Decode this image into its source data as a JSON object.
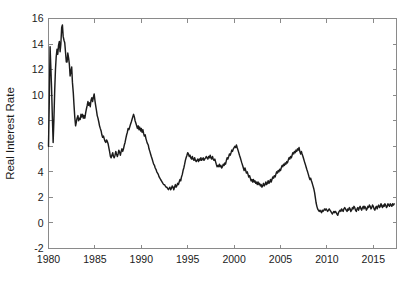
{
  "chart_data": {
    "type": "line",
    "title": "",
    "xlabel": "",
    "ylabel": "Real Interest Rate",
    "xlim": [
      1980.0,
      2017.5
    ],
    "ylim": [
      -2,
      16
    ],
    "xticks": [
      1980,
      1985,
      1990,
      1995,
      2000,
      2005,
      2010,
      2015
    ],
    "xticklabels": [
      "1980",
      "1985",
      "1990",
      "1995",
      "2000",
      "2005",
      "2010",
      "2015"
    ],
    "yticks": [
      -2,
      0,
      2,
      4,
      6,
      8,
      10,
      12,
      14,
      16
    ],
    "yticklabels": [
      "-2",
      "0",
      "2",
      "4",
      "6",
      "8",
      "10",
      "12",
      "14",
      "16"
    ],
    "grid": false,
    "legend": null,
    "line_color": "#1c1c1c",
    "axis_color": "#8a8a8a",
    "background_color": "#ffffff",
    "series": [
      {
        "name": "Real Interest Rate",
        "x": [
          1980.0,
          1980.08,
          1980.17,
          1980.25,
          1980.33,
          1980.42,
          1980.5,
          1980.58,
          1980.67,
          1980.75,
          1980.83,
          1980.92,
          1981.0,
          1981.08,
          1981.17,
          1981.25,
          1981.33,
          1981.42,
          1981.5,
          1981.58,
          1981.67,
          1981.75,
          1981.83,
          1981.92,
          1982.0,
          1982.08,
          1982.17,
          1982.25,
          1982.33,
          1982.42,
          1982.5,
          1982.58,
          1982.67,
          1982.75,
          1982.83,
          1982.92,
          1983.0,
          1983.08,
          1983.17,
          1983.25,
          1983.33,
          1983.42,
          1983.5,
          1983.58,
          1983.67,
          1983.75,
          1983.83,
          1983.92,
          1984.0,
          1984.08,
          1984.17,
          1984.25,
          1984.33,
          1984.42,
          1984.5,
          1984.58,
          1984.67,
          1984.75,
          1984.83,
          1984.92,
          1985.0,
          1985.08,
          1985.17,
          1985.25,
          1985.33,
          1985.42,
          1985.5,
          1985.58,
          1985.67,
          1985.75,
          1985.83,
          1985.92,
          1986.0,
          1986.08,
          1986.17,
          1986.25,
          1986.33,
          1986.42,
          1986.5,
          1986.58,
          1986.67,
          1986.75,
          1986.83,
          1986.92,
          1987.0,
          1987.08,
          1987.17,
          1987.25,
          1987.33,
          1987.42,
          1987.5,
          1987.58,
          1987.67,
          1987.75,
          1987.83,
          1987.92,
          1988.0,
          1988.08,
          1988.17,
          1988.25,
          1988.33,
          1988.42,
          1988.5,
          1988.58,
          1988.67,
          1988.75,
          1988.83,
          1988.92,
          1989.0,
          1989.08,
          1989.17,
          1989.25,
          1989.33,
          1989.42,
          1989.5,
          1989.58,
          1989.67,
          1989.75,
          1989.83,
          1989.92,
          1990.0,
          1990.08,
          1990.17,
          1990.25,
          1990.33,
          1990.42,
          1990.5,
          1990.58,
          1990.67,
          1990.75,
          1990.83,
          1990.92,
          1991.0,
          1991.08,
          1991.17,
          1991.25,
          1991.33,
          1991.42,
          1991.5,
          1991.58,
          1991.67,
          1991.75,
          1991.83,
          1991.92,
          1992.0,
          1992.08,
          1992.17,
          1992.25,
          1992.33,
          1992.42,
          1992.5,
          1992.58,
          1992.67,
          1992.75,
          1992.83,
          1992.92,
          1993.0,
          1993.08,
          1993.17,
          1993.25,
          1993.33,
          1993.42,
          1993.5,
          1993.58,
          1993.67,
          1993.75,
          1993.83,
          1993.92,
          1994.0,
          1994.08,
          1994.17,
          1994.25,
          1994.33,
          1994.42,
          1994.5,
          1994.58,
          1994.67,
          1994.75,
          1994.83,
          1994.92,
          1995.0,
          1995.08,
          1995.17,
          1995.25,
          1995.33,
          1995.42,
          1995.5,
          1995.58,
          1995.67,
          1995.75,
          1995.83,
          1995.92,
          1996.0,
          1996.08,
          1996.17,
          1996.25,
          1996.33,
          1996.42,
          1996.5,
          1996.58,
          1996.67,
          1996.75,
          1996.83,
          1996.92,
          1997.0,
          1997.08,
          1997.17,
          1997.25,
          1997.33,
          1997.42,
          1997.5,
          1997.58,
          1997.67,
          1997.75,
          1997.83,
          1997.92,
          1998.0,
          1998.08,
          1998.17,
          1998.25,
          1998.33,
          1998.42,
          1998.5,
          1998.58,
          1998.67,
          1998.75,
          1998.83,
          1998.92,
          1999.0,
          1999.08,
          1999.17,
          1999.25,
          1999.33,
          1999.42,
          1999.5,
          1999.58,
          1999.67,
          1999.75,
          1999.83,
          1999.92,
          2000.0,
          2000.08,
          2000.17,
          2000.25,
          2000.33,
          2000.42,
          2000.5,
          2000.58,
          2000.67,
          2000.75,
          2000.83,
          2000.92,
          2001.0,
          2001.08,
          2001.17,
          2001.25,
          2001.33,
          2001.42,
          2001.5,
          2001.58,
          2001.67,
          2001.75,
          2001.83,
          2001.92,
          2002.0,
          2002.08,
          2002.17,
          2002.25,
          2002.33,
          2002.42,
          2002.5,
          2002.58,
          2002.67,
          2002.75,
          2002.83,
          2002.92,
          2003.0,
          2003.08,
          2003.17,
          2003.25,
          2003.33,
          2003.42,
          2003.5,
          2003.58,
          2003.67,
          2003.75,
          2003.83,
          2003.92,
          2004.0,
          2004.08,
          2004.17,
          2004.25,
          2004.33,
          2004.42,
          2004.5,
          2004.58,
          2004.67,
          2004.75,
          2004.83,
          2004.92,
          2005.0,
          2005.08,
          2005.17,
          2005.25,
          2005.33,
          2005.42,
          2005.5,
          2005.58,
          2005.67,
          2005.75,
          2005.83,
          2005.92,
          2006.0,
          2006.08,
          2006.17,
          2006.25,
          2006.33,
          2006.42,
          2006.5,
          2006.58,
          2006.67,
          2006.75,
          2006.83,
          2006.92,
          2007.0,
          2007.08,
          2007.17,
          2007.25,
          2007.33,
          2007.42,
          2007.5,
          2007.58,
          2007.67,
          2007.75,
          2007.83,
          2007.92,
          2008.0,
          2008.08,
          2008.17,
          2008.25,
          2008.33,
          2008.42,
          2008.5,
          2008.58,
          2008.67,
          2008.75,
          2008.83,
          2008.92,
          2009.0,
          2009.08,
          2009.17,
          2009.25,
          2009.33,
          2009.42,
          2009.5,
          2009.58,
          2009.67,
          2009.75,
          2009.83,
          2009.92,
          2010.0,
          2010.08,
          2010.17,
          2010.25,
          2010.33,
          2010.42,
          2010.5,
          2010.58,
          2010.67,
          2010.75,
          2010.83,
          2010.92,
          2011.0,
          2011.08,
          2011.17,
          2011.25,
          2011.33,
          2011.42,
          2011.5,
          2011.58,
          2011.67,
          2011.75,
          2011.83,
          2011.92,
          2012.0,
          2012.08,
          2012.17,
          2012.25,
          2012.33,
          2012.42,
          2012.5,
          2012.58,
          2012.67,
          2012.75,
          2012.83,
          2012.92,
          2013.0,
          2013.08,
          2013.17,
          2013.25,
          2013.33,
          2013.42,
          2013.5,
          2013.58,
          2013.67,
          2013.75,
          2013.83,
          2013.92,
          2014.0,
          2014.08,
          2014.17,
          2014.25,
          2014.33,
          2014.42,
          2014.5,
          2014.58,
          2014.67,
          2014.75,
          2014.83,
          2014.92,
          2015.0,
          2015.08,
          2015.17,
          2015.25,
          2015.33,
          2015.42,
          2015.5,
          2015.58,
          2015.67,
          2015.75,
          2015.83,
          2015.92,
          2016.0,
          2016.08,
          2016.17,
          2016.25,
          2016.33,
          2016.42,
          2016.5,
          2016.58,
          2016.67,
          2016.75,
          2016.83,
          2016.92,
          2017.0,
          2017.08,
          2017.17,
          2017.25
        ],
        "values": [
          6.0,
          9.3,
          13.8,
          12.2,
          10.6,
          8.2,
          6.3,
          8.0,
          10.4,
          12.0,
          13.0,
          13.6,
          13.2,
          13.9,
          14.2,
          13.4,
          14.0,
          15.3,
          15.5,
          14.6,
          14.3,
          14.1,
          13.4,
          12.6,
          12.6,
          13.3,
          12.9,
          12.4,
          11.5,
          11.9,
          12.2,
          11.0,
          10.2,
          9.2,
          8.3,
          7.6,
          7.9,
          8.2,
          8.4,
          8.0,
          8.2,
          8.1,
          8.5,
          8.3,
          8.5,
          8.2,
          8.4,
          8.2,
          8.6,
          8.9,
          9.2,
          9.5,
          9.2,
          9.4,
          9.1,
          9.6,
          9.8,
          9.5,
          9.8,
          10.1,
          9.6,
          9.2,
          8.8,
          8.4,
          8.2,
          7.9,
          7.6,
          7.4,
          7.2,
          6.9,
          6.7,
          6.8,
          6.6,
          6.4,
          6.3,
          6.5,
          6.4,
          6.2,
          5.9,
          5.6,
          5.2,
          5.1,
          5.3,
          5.5,
          5.2,
          5.1,
          5.3,
          5.6,
          5.4,
          5.2,
          5.4,
          5.7,
          5.5,
          5.3,
          5.6,
          5.8,
          5.6,
          5.8,
          6.1,
          6.3,
          6.6,
          6.9,
          7.1,
          7.4,
          7.3,
          7.5,
          7.7,
          7.9,
          8.1,
          8.3,
          8.5,
          8.3,
          8.0,
          7.8,
          7.6,
          7.4,
          7.6,
          7.3,
          7.5,
          7.2,
          7.4,
          7.1,
          7.3,
          7.0,
          6.8,
          6.9,
          6.6,
          6.4,
          6.2,
          6.1,
          5.8,
          5.6,
          5.4,
          5.2,
          5.0,
          4.8,
          4.6,
          4.5,
          4.3,
          4.2,
          4.0,
          3.9,
          3.8,
          3.6,
          3.5,
          3.4,
          3.3,
          3.2,
          3.1,
          3.0,
          3.0,
          2.9,
          2.8,
          2.8,
          2.7,
          2.6,
          2.7,
          2.8,
          2.6,
          2.7,
          2.9,
          2.8,
          2.6,
          2.8,
          3.0,
          2.8,
          2.9,
          3.1,
          3.0,
          3.2,
          3.4,
          3.3,
          3.6,
          3.8,
          4.1,
          4.3,
          4.6,
          4.9,
          5.1,
          5.3,
          5.5,
          5.4,
          5.2,
          5.3,
          5.1,
          5.0,
          5.2,
          5.0,
          4.9,
          5.1,
          4.9,
          4.8,
          4.9,
          5.0,
          4.8,
          5.0,
          4.9,
          5.1,
          4.9,
          5.0,
          5.1,
          4.9,
          5.0,
          5.1,
          5.2,
          5.1,
          5.0,
          5.2,
          5.1,
          5.3,
          5.1,
          5.0,
          5.2,
          5.0,
          4.9,
          5.0,
          4.8,
          4.6,
          4.4,
          4.5,
          4.4,
          4.6,
          4.4,
          4.5,
          4.3,
          4.4,
          4.6,
          4.5,
          4.7,
          4.6,
          4.9,
          5.1,
          5.0,
          5.2,
          5.4,
          5.3,
          5.5,
          5.7,
          5.6,
          5.8,
          5.9,
          6.0,
          5.9,
          6.1,
          5.9,
          5.7,
          5.5,
          5.3,
          5.1,
          4.9,
          4.7,
          4.5,
          4.3,
          4.1,
          4.3,
          4.1,
          3.9,
          4.0,
          3.8,
          3.6,
          3.7,
          3.5,
          3.3,
          3.4,
          3.2,
          3.4,
          3.2,
          3.3,
          3.1,
          3.2,
          3.0,
          3.2,
          3.0,
          3.1,
          2.9,
          3.0,
          2.8,
          2.9,
          3.1,
          2.9,
          3.0,
          3.2,
          3.0,
          3.1,
          3.3,
          3.1,
          3.2,
          3.4,
          3.2,
          3.4,
          3.6,
          3.5,
          3.7,
          3.6,
          3.8,
          4.0,
          3.9,
          4.1,
          4.0,
          4.2,
          4.1,
          4.3,
          4.5,
          4.4,
          4.6,
          4.5,
          4.7,
          4.6,
          4.8,
          4.7,
          4.9,
          5.1,
          5.0,
          5.2,
          5.1,
          5.3,
          5.5,
          5.4,
          5.6,
          5.5,
          5.7,
          5.6,
          5.8,
          5.7,
          5.9,
          5.6,
          5.4,
          5.6,
          5.4,
          5.2,
          5.0,
          4.8,
          4.6,
          4.4,
          4.2,
          4.0,
          3.8,
          3.6,
          3.4,
          3.5,
          3.3,
          3.1,
          2.9,
          2.7,
          2.4,
          2.0,
          1.6,
          1.3,
          1.1,
          1.0,
          0.9,
          1.0,
          0.9,
          0.8,
          1.0,
          0.9,
          1.0,
          1.1,
          1.0,
          1.1,
          1.0,
          0.9,
          1.0,
          1.1,
          1.0,
          0.9,
          0.8,
          0.7,
          0.8,
          0.9,
          0.8,
          0.9,
          0.8,
          0.7,
          0.6,
          0.8,
          0.9,
          1.0,
          0.9,
          1.1,
          1.0,
          0.9,
          1.1,
          1.2,
          1.1,
          1.0,
          0.9,
          1.1,
          1.0,
          1.2,
          1.1,
          0.9,
          1.0,
          1.2,
          1.1,
          1.3,
          1.2,
          1.0,
          0.9,
          1.1,
          1.2,
          1.0,
          1.2,
          1.3,
          1.1,
          1.0,
          1.2,
          1.3,
          1.1,
          1.3,
          1.2,
          1.0,
          1.1,
          1.3,
          1.2,
          1.4,
          1.3,
          1.1,
          1.2,
          1.4,
          1.3,
          1.1,
          1.0,
          1.2,
          1.3,
          1.1,
          1.3,
          1.4,
          1.2,
          1.3,
          1.5,
          1.3,
          1.2,
          1.4,
          1.3,
          1.5,
          1.4,
          1.2,
          1.3,
          1.5,
          1.4,
          1.3,
          1.5,
          1.4,
          1.3,
          1.5,
          1.4,
          1.5
        ]
      }
    ]
  }
}
